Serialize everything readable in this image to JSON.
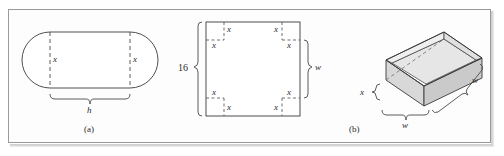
{
  "figure": {
    "kind": "textbook-math-figure",
    "background_color": "#ffffff",
    "border_color": "#9a9a9a",
    "stroke_color": "#3a3a3a",
    "dash_color": "#555555",
    "shade_top_color": "#e8e8e8",
    "shade_side_color": "#cfcfcf",
    "shade_front_color": "#dcdcdc"
  },
  "panel_a": {
    "caption": "(a)",
    "description": "Stadium shape: rectangle with semicircular ends",
    "labels": {
      "left_x": "x",
      "right_x": "x",
      "brace_h": "h"
    }
  },
  "panel_b_flat": {
    "description": "Square sheet of side 16 with square corners of side x removed",
    "labels": {
      "side_16": "16",
      "width_w": "w",
      "corner_tl_v": "x",
      "corner_tl_h": "x",
      "corner_tr_v": "x",
      "corner_tr_h": "x",
      "corner_bl_v": "x",
      "corner_bl_h": "x",
      "corner_br_v": "x",
      "corner_br_h": "x"
    }
  },
  "panel_b_box": {
    "caption": "(b)",
    "description": "Open-top rectangular box of height x and square base w by w",
    "labels": {
      "height_x": "x",
      "depth_w": "w",
      "width_w": "w"
    }
  }
}
